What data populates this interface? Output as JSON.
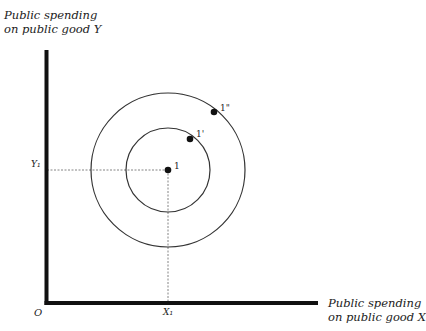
{
  "diagram": {
    "y_axis_label_line1": "Public spending",
    "y_axis_label_line2": "on public good Y",
    "x_axis_label_line1": "Public spending",
    "x_axis_label_line2": "on public good X",
    "origin_label": "O",
    "x_tick_label": "X₁",
    "y_tick_label": "Y₁",
    "points": [
      {
        "label": "1",
        "role": "ideal point"
      },
      {
        "label": "1'",
        "role": "point on inner indifference circle"
      },
      {
        "label": "1\"",
        "role": "point on outer indifference circle"
      }
    ],
    "curves": [
      {
        "name": "inner indifference circle"
      },
      {
        "name": "outer indifference circle"
      }
    ],
    "colors": {
      "axis": "#111111",
      "curve": "#333333",
      "guide": "#555555"
    }
  }
}
